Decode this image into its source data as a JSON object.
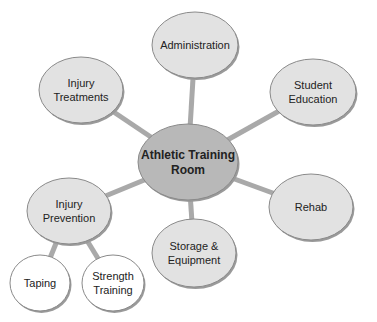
{
  "diagram": {
    "type": "concept-map",
    "center": {
      "id": "athletic-training-room",
      "lines": [
        "Athletic Training",
        "Room"
      ],
      "cx": 188,
      "cy": 162,
      "rx": 50,
      "ry": 38,
      "fill": "#b8b8b8"
    },
    "nodes": [
      {
        "id": "administration",
        "lines": [
          "Administration"
        ],
        "cx": 195,
        "cy": 45,
        "rx": 43,
        "ry": 33,
        "fill": "#e2e2e2"
      },
      {
        "id": "student-education",
        "lines": [
          "Student",
          "Education"
        ],
        "cx": 313,
        "cy": 92,
        "rx": 43,
        "ry": 33,
        "fill": "#e2e2e2"
      },
      {
        "id": "injury-treatments",
        "lines": [
          "Injury",
          "Treatments"
        ],
        "cx": 81,
        "cy": 90,
        "rx": 42,
        "ry": 33,
        "fill": "#e2e2e2"
      },
      {
        "id": "rehab",
        "lines": [
          "Rehab"
        ],
        "cx": 311,
        "cy": 207,
        "rx": 42,
        "ry": 33,
        "fill": "#e2e2e2"
      },
      {
        "id": "storage-equipment",
        "lines": [
          "Storage &",
          "Equipment"
        ],
        "cx": 194,
        "cy": 253,
        "rx": 42,
        "ry": 34,
        "fill": "#e2e2e2"
      },
      {
        "id": "injury-prevention",
        "lines": [
          "Injury",
          "Prevention"
        ],
        "cx": 69,
        "cy": 211,
        "rx": 42,
        "ry": 33,
        "fill": "#e2e2e2"
      },
      {
        "id": "taping",
        "lines": [
          "Taping"
        ],
        "cx": 40,
        "cy": 283,
        "rx": 30,
        "ry": 28,
        "fill": "#ffffff"
      },
      {
        "id": "strength-training",
        "lines": [
          "Strength",
          "Training"
        ],
        "cx": 113,
        "cy": 283,
        "rx": 31,
        "ry": 28,
        "fill": "#ffffff"
      }
    ],
    "edges": [
      {
        "from": "athletic-training-room",
        "to": "administration"
      },
      {
        "from": "athletic-training-room",
        "to": "student-education"
      },
      {
        "from": "athletic-training-room",
        "to": "injury-treatments"
      },
      {
        "from": "athletic-training-room",
        "to": "rehab"
      },
      {
        "from": "athletic-training-room",
        "to": "storage-equipment"
      },
      {
        "from": "athletic-training-room",
        "to": "injury-prevention"
      },
      {
        "from": "injury-prevention",
        "to": "taping"
      },
      {
        "from": "injury-prevention",
        "to": "strength-training"
      }
    ],
    "colors": {
      "edge": "#a9a9a9",
      "outline": "#8a8a8a",
      "shadow": "#9a9a9a",
      "text": "#222222"
    }
  }
}
